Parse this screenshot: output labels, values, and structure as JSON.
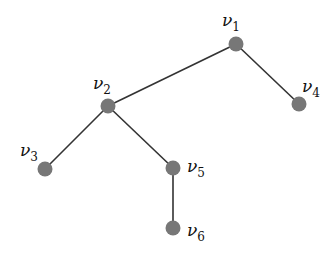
{
  "diagram": {
    "type": "tree",
    "nodes": [
      {
        "id": "v1",
        "label": "ν",
        "sub": "1",
        "x": 236,
        "y": 44,
        "lx": 222,
        "ly": 26
      },
      {
        "id": "v2",
        "label": "ν",
        "sub": "2",
        "x": 108,
        "y": 106,
        "lx": 93,
        "ly": 89
      },
      {
        "id": "v3",
        "label": "ν",
        "sub": "3",
        "x": 45,
        "y": 169,
        "lx": 20,
        "ly": 156
      },
      {
        "id": "v4",
        "label": "ν",
        "sub": "4",
        "x": 299,
        "y": 104,
        "lx": 302,
        "ly": 92
      },
      {
        "id": "v5",
        "label": "ν",
        "sub": "5",
        "x": 173,
        "y": 168,
        "lx": 187,
        "ly": 172
      },
      {
        "id": "v6",
        "label": "ν",
        "sub": "6",
        "x": 173,
        "y": 228,
        "lx": 187,
        "ly": 236
      }
    ],
    "edges": [
      [
        "v1",
        "v2"
      ],
      [
        "v1",
        "v4"
      ],
      [
        "v2",
        "v3"
      ],
      [
        "v2",
        "v5"
      ],
      [
        "v5",
        "v6"
      ]
    ],
    "node_color": "#777777",
    "edge_color": "#333333"
  }
}
